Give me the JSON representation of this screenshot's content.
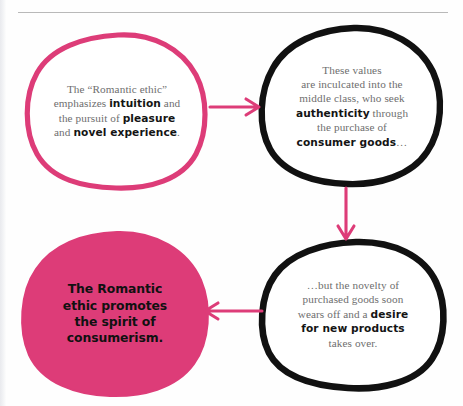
{
  "page": {
    "background_color": "#fefefe",
    "accent_color": "#dd3c78",
    "outline_color": "#111111",
    "body_text_color": "#6e6e6e",
    "rule_color": "#b9b9b9"
  },
  "diagram": {
    "type": "cycle-flow",
    "nodes": [
      {
        "id": "romantic-ethic",
        "style": "pink-outline",
        "text_runs": [
          {
            "text": "The “Romantic ethic”",
            "bold": false
          },
          {
            "text": " emphasizes ",
            "bold": false
          },
          {
            "text": "intuition",
            "bold": true
          },
          {
            "text": " and the pursuit of ",
            "bold": false
          },
          {
            "text": "pleasure",
            "bold": true
          },
          {
            "text": " and ",
            "bold": false
          },
          {
            "text": "novel experience",
            "bold": true
          },
          {
            "text": ".",
            "bold": false
          }
        ],
        "plain_text": "The “Romantic ethic” emphasizes intuition and the pursuit of pleasure and novel experience."
      },
      {
        "id": "middle-class",
        "style": "black-outline",
        "text_runs": [
          {
            "text": "These values are inculcated into the middle class, who seek ",
            "bold": false
          },
          {
            "text": "authenticity",
            "bold": true
          },
          {
            "text": " through the purchase of ",
            "bold": false
          },
          {
            "text": "consumer goods",
            "bold": true
          },
          {
            "text": "…",
            "bold": false
          }
        ],
        "plain_text": "These values are inculcated into the middle class, who seek authenticity through the purchase of consumer goods…"
      },
      {
        "id": "novelty",
        "style": "black-outline",
        "text_runs": [
          {
            "text": "…but the novelty of purchased goods soon wears off and a ",
            "bold": false
          },
          {
            "text": "desire for new products",
            "bold": true
          },
          {
            "text": " takes over.",
            "bold": false
          }
        ],
        "plain_text": "…but the novelty of purchased goods soon wears off and a desire for new products takes over."
      },
      {
        "id": "consumerism",
        "style": "pink-filled",
        "text_runs": [
          {
            "text": "The Romantic ethic promotes the spirit of consumerism.",
            "bold": true
          }
        ],
        "plain_text": "The Romantic ethic promotes the spirit of consumerism."
      }
    ],
    "arrows": [
      {
        "id": "arrow-right",
        "from": "romantic-ethic",
        "to": "middle-class",
        "direction": "right",
        "color": "#dd3c78"
      },
      {
        "id": "arrow-down",
        "from": "middle-class",
        "to": "novelty",
        "direction": "down",
        "color": "#dd3c78"
      },
      {
        "id": "arrow-left",
        "from": "novelty",
        "to": "consumerism",
        "direction": "left",
        "color": "#dd3c78"
      }
    ]
  }
}
